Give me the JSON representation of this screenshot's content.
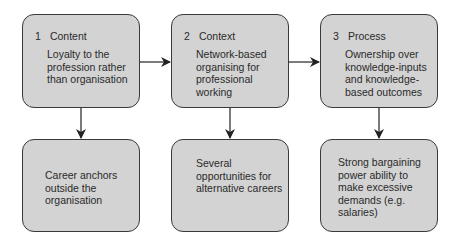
{
  "boxes": [
    {
      "number": "1",
      "title": "Content",
      "text": "Loyalty to the profession rather than organisation",
      "outcome": "Career anchors outside the organisation"
    },
    {
      "number": "2",
      "title": "Context",
      "text": "Network-based organising for professional working",
      "outcome": "Several opportunities for alternative careers"
    },
    {
      "number": "3",
      "title": "Process",
      "text": "Ownership over knowledge-inputs and knowledge-based outcomes",
      "outcome": "Strong bargaining power ability to make excessive demands (e.g. salaries)"
    }
  ],
  "colors": {
    "box_fill": "#d3d3d3",
    "border": "#3a3a3a",
    "arrow": "#222222"
  }
}
